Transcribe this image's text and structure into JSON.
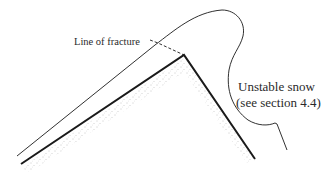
{
  "diagram": {
    "type": "cross-section illustration",
    "labels": {
      "fracture": "Line of fracture",
      "snow_line1": "Unstable snow",
      "snow_line2": "(see section 4.4)"
    },
    "elements": [
      {
        "name": "ground-surface",
        "style": "thick solid line",
        "points": [
          [
            21,
            164
          ],
          [
            184,
            55
          ],
          [
            255,
            159
          ]
        ]
      },
      {
        "name": "snow-surface",
        "style": "thin solid outline",
        "description": "top of snow layer rising to overhanging cornice"
      },
      {
        "name": "fracture-line",
        "style": "dashed",
        "from": [
          158,
          41
        ],
        "to": [
          184,
          55
        ]
      },
      {
        "name": "subsurface-stipple",
        "style": "dotted fill below ground line"
      }
    ],
    "colors": {
      "line": "#1a1a1a",
      "text": "#2a2a2a",
      "stipple": "#888888",
      "background": "#ffffff"
    }
  }
}
